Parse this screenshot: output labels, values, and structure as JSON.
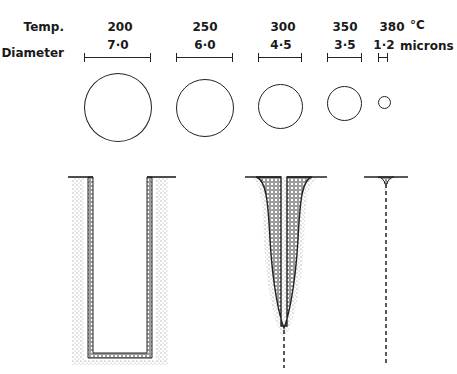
{
  "header": {
    "temp_label": "Temp.",
    "diameter_label": "Diameter",
    "temp_unit": "°C",
    "diameter_unit": "microns"
  },
  "columns": [
    {
      "temp": "200",
      "diameter": "7·0"
    },
    {
      "temp": "250",
      "diameter": "6·0"
    },
    {
      "temp": "300",
      "diameter": "4·5"
    },
    {
      "temp": "350",
      "diameter": "3·5"
    },
    {
      "temp": "380",
      "diameter": "1·2"
    }
  ],
  "diagrams": [
    {
      "name": "cross-section-200",
      "shape": "U-shaped hollow channel with thick stippled walls"
    },
    {
      "name": "cross-section-300",
      "shape": "tapered V-shaped channel ending in dashed line"
    },
    {
      "name": "cross-section-380",
      "shape": "small surface pit with dashed line below"
    }
  ],
  "colors": {
    "ink": "#222222",
    "background": "#ffffff"
  }
}
